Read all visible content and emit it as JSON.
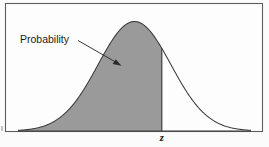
{
  "figure": {
    "annotation_label": "Probability",
    "z_label": "z",
    "colors": {
      "shade_fill": "#9a9a9a",
      "curve_stroke": "#3a3a3a",
      "frame_stroke": "#5d5d5d",
      "background": "#fdfdfd",
      "text": "#1c1c1c"
    }
  },
  "chart_data": {
    "type": "area",
    "xlabel": "",
    "ylabel": "",
    "grid": false,
    "legend": null,
    "distribution": "normal",
    "mean": 0,
    "sd": 1,
    "cutoff_label": "z",
    "cutoff_x": 0.75,
    "shaded_region": "left-of-z",
    "shaded_fill": "#9a9a9a",
    "xlim": [
      -3.2,
      3.2
    ],
    "ylim": [
      0,
      0.43
    ],
    "x": [
      -3.2,
      -3.0,
      -2.8,
      -2.6,
      -2.4,
      -2.2,
      -2.0,
      -1.8,
      -1.6,
      -1.4,
      -1.2,
      -1.0,
      -0.8,
      -0.6,
      -0.4,
      -0.2,
      0.0,
      0.2,
      0.4,
      0.6,
      0.75,
      0.8,
      1.0,
      1.2,
      1.4,
      1.6,
      1.8,
      2.0,
      2.2,
      2.4,
      2.6,
      2.8,
      3.0,
      3.2
    ],
    "y": [
      0.0024,
      0.0044,
      0.0079,
      0.0136,
      0.0224,
      0.0355,
      0.054,
      0.079,
      0.1109,
      0.1497,
      0.1942,
      0.242,
      0.2897,
      0.3332,
      0.3683,
      0.391,
      0.3989,
      0.391,
      0.3683,
      0.3332,
      0.3011,
      0.2897,
      0.242,
      0.1942,
      0.1497,
      0.1109,
      0.079,
      0.054,
      0.0355,
      0.0224,
      0.0136,
      0.0079,
      0.0044,
      0.0024
    ],
    "annotations": [
      {
        "text": "Probability",
        "points_to": "shaded-area",
        "arrow": true
      },
      {
        "text": "z",
        "position": "below-axis-at-cutoff",
        "arrow": false
      }
    ]
  }
}
